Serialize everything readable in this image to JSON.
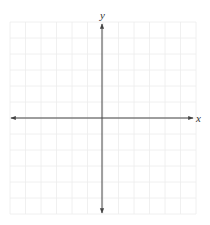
{
  "diagram": {
    "type": "coordinate-plane",
    "x_axis_label": "x",
    "y_axis_label": "y",
    "grid": {
      "columns": 12,
      "rows": 12,
      "line_color": "#ececec",
      "visible": true
    },
    "axis_color": "#444444",
    "arrows": "both-ends"
  }
}
